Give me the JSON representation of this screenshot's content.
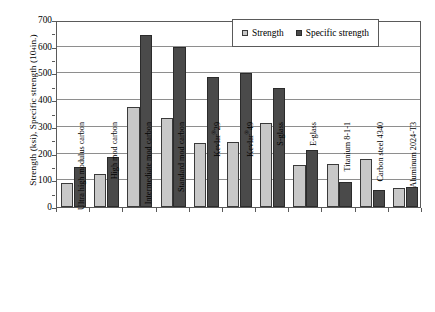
{
  "chart_data": {
    "type": "bar",
    "title": "",
    "xlabel": "",
    "ylabel": "Strength (ksi), Specific strength (10",
    "ylabel_exponent": "4",
    "ylabel_tail": " in.)",
    "ylim": [
      0,
      700
    ],
    "ytick_values": [
      0,
      100,
      200,
      300,
      400,
      500,
      600,
      700
    ],
    "ytick_labels": [
      "0",
      "100",
      "200",
      "300",
      "400",
      "500",
      "600",
      "700"
    ],
    "grid": true,
    "legend_position": "top-right",
    "categories": [
      "Ultra high modulus carbon",
      "High mod carbon",
      "Intermediate mod carbon",
      "Standard mod carbon",
      "Kevlar®29",
      "Kevlar®49",
      "S-glass",
      "E-glass",
      "Titanium 8-1-1",
      "Carbon steel 4340",
      "Aluminum 2024-T3"
    ],
    "series": [
      {
        "name": "Strength",
        "color": "#c8c8c8",
        "values": [
          90,
          123,
          375,
          333,
          240,
          242,
          315,
          158,
          160,
          178,
          72
        ]
      },
      {
        "name": "Specific strength",
        "color": "#4a4a4a",
        "values": [
          148,
          188,
          645,
          598,
          488,
          500,
          447,
          212,
          95,
          65,
          75
        ]
      }
    ]
  },
  "legend": {
    "items": [
      {
        "label": "Strength",
        "swatch": "strength"
      },
      {
        "label": "Specific strength",
        "swatch": "specific"
      }
    ]
  }
}
